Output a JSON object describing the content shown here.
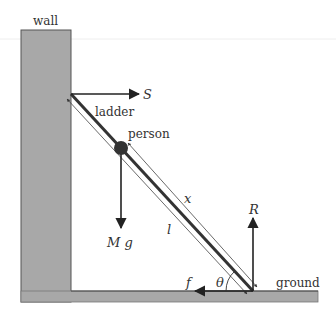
{
  "diagram": {
    "labels": {
      "wall": "wall",
      "ground": "ground",
      "ladder": "ladder",
      "person": "person",
      "S": "S",
      "Mg": "M g",
      "R": "R",
      "f": "f",
      "theta": "θ",
      "x": "x",
      "l": "l"
    },
    "colors": {
      "surface_fill": "#a8a8a8",
      "surface_stroke": "#555555",
      "ladder": "#333333",
      "arrow": "#222222",
      "dimension": "#444444",
      "text": "#333333"
    },
    "geometry": {
      "wall": {
        "x": 21,
        "y": 30,
        "w": 50,
        "h": 272
      },
      "ground": {
        "x": 21,
        "y": 291,
        "w": 297,
        "h": 11
      },
      "ladder": {
        "x1": 71,
        "y1": 94,
        "x2": 253,
        "y2": 291
      },
      "person": {
        "cx": 121,
        "cy": 148,
        "r": 7
      }
    }
  }
}
